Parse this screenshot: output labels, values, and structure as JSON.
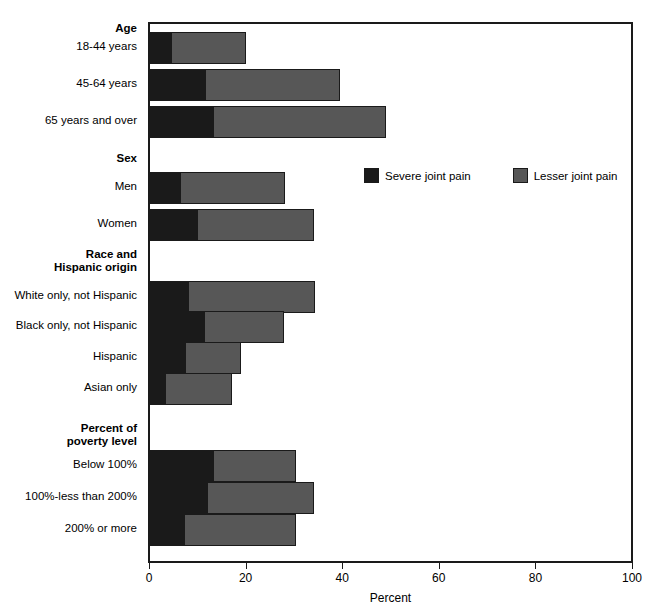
{
  "chart_data": {
    "type": "bar",
    "subtype": "stacked-horizontal-bar",
    "title": "",
    "xlabel": "Percent",
    "ylabel": "",
    "xlim": [
      0,
      100
    ],
    "xticks": [
      0,
      20,
      40,
      60,
      80,
      100
    ],
    "grid": false,
    "legend_position": "inside-upper-right",
    "series": [
      {
        "name": "Severe joint pain",
        "color": "#1a1a1a",
        "values": [
          4.3,
          11.4,
          13.2,
          6.3,
          9.8,
          7.9,
          11.2,
          7.2,
          3.2,
          13.1,
          11.8,
          7.1
        ]
      },
      {
        "name": "Lesser joint pain",
        "color": "#575757",
        "values": [
          15.7,
          28.0,
          35.8,
          21.7,
          24.2,
          26.5,
          16.6,
          11.8,
          13.8,
          17.2,
          22.2,
          23.2
        ]
      }
    ],
    "categories": [
      "18-44 years",
      "45-64 years",
      "65 years and over",
      "Men",
      "Women",
      "White only, not Hispanic",
      "Black only, not Hispanic",
      "Hispanic",
      "Asian only",
      "Below 100%",
      "100%-less than 200%",
      "200% or more"
    ],
    "totals": [
      20.0,
      39.4,
      49.0,
      28.0,
      34.0,
      34.4,
      27.8,
      19.0,
      17.0,
      30.3,
      34.0,
      30.3
    ],
    "group_headers": [
      "Age",
      "Sex",
      "Race and Hispanic origin",
      "Percent of poverty level"
    ]
  },
  "legend": {
    "items": [
      {
        "label": "Severe joint pain",
        "swatch": "severe"
      },
      {
        "label": "Lesser joint pain",
        "swatch": "lesser"
      }
    ]
  },
  "axis": {
    "title": "Percent",
    "ticks": [
      {
        "label": "0",
        "value": 0
      },
      {
        "label": "20",
        "value": 20
      },
      {
        "label": "40",
        "value": 40
      },
      {
        "label": "60",
        "value": 60
      },
      {
        "label": "80",
        "value": 80
      },
      {
        "label": "100",
        "value": 100
      }
    ]
  },
  "rows": [
    {
      "kind": "header",
      "label": "Age",
      "y": 22
    },
    {
      "kind": "bar",
      "label": "18-44 years",
      "y": 40,
      "severe": 4.3,
      "lesser": 15.7,
      "total": 20.0
    },
    {
      "kind": "bar",
      "label": "45-64 years",
      "y": 77,
      "severe": 11.4,
      "lesser": 28.0,
      "total": 39.4
    },
    {
      "kind": "bar",
      "label": "65 years and over",
      "y": 114,
      "severe": 13.2,
      "lesser": 35.8,
      "total": 49.0
    },
    {
      "kind": "header",
      "label": "Sex",
      "y": 152
    },
    {
      "kind": "bar",
      "label": "Men",
      "y": 180,
      "severe": 6.3,
      "lesser": 21.7,
      "total": 28.0
    },
    {
      "kind": "bar",
      "label": "Women",
      "y": 217,
      "severe": 9.8,
      "lesser": 24.2,
      "total": 34.0
    },
    {
      "kind": "header2",
      "label": "Race and\nHispanic origin",
      "y": 248
    },
    {
      "kind": "bar",
      "label": "White only, not Hispanic",
      "y": 289,
      "severe": 7.9,
      "lesser": 26.5,
      "total": 34.4
    },
    {
      "kind": "bar",
      "label": "Black only, not Hispanic",
      "y": 319,
      "severe": 11.2,
      "lesser": 16.6,
      "total": 27.8
    },
    {
      "kind": "bar",
      "label": "Hispanic",
      "y": 350,
      "severe": 7.2,
      "lesser": 11.8,
      "total": 19.0
    },
    {
      "kind": "bar",
      "label": "Asian only",
      "y": 381,
      "severe": 3.2,
      "lesser": 13.8,
      "total": 17.0
    },
    {
      "kind": "header2",
      "label": "Percent of\npoverty level",
      "y": 422
    },
    {
      "kind": "bar",
      "label": "Below 100%",
      "y": 458,
      "severe": 13.1,
      "lesser": 17.2,
      "total": 30.3
    },
    {
      "kind": "bar",
      "label": "100%-less than 200%",
      "y": 490,
      "severe": 11.8,
      "lesser": 22.2,
      "total": 34.0
    },
    {
      "kind": "bar",
      "label": "200% or more",
      "y": 522,
      "severe": 7.1,
      "lesser": 23.2,
      "total": 30.3
    }
  ]
}
